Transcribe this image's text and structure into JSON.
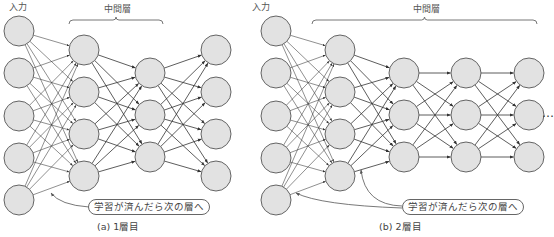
{
  "panels": [
    {
      "id": "a",
      "input_label": "入力",
      "hidden_label": "中間層",
      "bubble_text": "学習が済んだら次の層へ",
      "caption": "(a) 1層目",
      "layers": [
        {
          "x": 19,
          "ys": [
            31,
            73,
            116,
            158,
            200
          ]
        },
        {
          "x": 84,
          "ys": [
            50,
            92,
            134,
            176
          ]
        },
        {
          "x": 150,
          "ys": [
            73,
            115,
            157
          ]
        },
        {
          "x": 216,
          "ys": [
            50,
            92,
            134,
            176
          ]
        }
      ],
      "bracket": {
        "x1": 69,
        "x2": 163,
        "y": 20
      },
      "bubble": {
        "left": 88,
        "top": 199,
        "width": 112
      },
      "caption_pos": {
        "left": 97,
        "top": 222
      },
      "input_label_pos": {
        "left": 9,
        "top": 3
      },
      "hidden_label_pos": {
        "left": 104,
        "top": 5
      },
      "pointers": [
        {
          "from": [
            89,
            207
          ],
          "ctrl": [
            60,
            205
          ],
          "to": [
            51,
            193
          ]
        }
      ]
    },
    {
      "id": "b",
      "input_label": "入力",
      "hidden_label": "中間層",
      "bubble_text": "学習が済んだら次の層へ",
      "caption": "(b) 2層目",
      "layers": [
        {
          "x": 276,
          "ys": [
            31,
            73,
            116,
            158,
            200
          ]
        },
        {
          "x": 340,
          "ys": [
            50,
            92,
            134,
            176
          ]
        },
        {
          "x": 404,
          "ys": [
            73,
            115,
            157
          ]
        },
        {
          "x": 466,
          "ys": [
            73,
            115,
            157
          ]
        },
        {
          "x": 529,
          "ys": [
            73,
            115,
            157
          ]
        }
      ],
      "bracket": {
        "x1": 312,
        "x2": 537,
        "y": 20
      },
      "bubble": {
        "left": 402,
        "top": 199,
        "width": 112
      },
      "caption_pos": {
        "left": 379,
        "top": 222
      },
      "input_label_pos": {
        "left": 252,
        "top": 3
      },
      "hidden_label_pos": {
        "left": 413,
        "top": 5
      },
      "pointers": [
        {
          "from": [
            402,
            208
          ],
          "ctrl": [
            320,
            205
          ],
          "to": [
            296,
            193
          ]
        },
        {
          "from": [
            402,
            206
          ],
          "ctrl": [
            365,
            205
          ],
          "to": [
            361,
            170
          ]
        }
      ]
    }
  ],
  "continuation": "…",
  "colors": {
    "node_fill": "#e2e2e2",
    "node_stroke": "#555555",
    "edge": "#333333",
    "bracket": "#666666",
    "text": "#555555"
  },
  "node_radius": 15
}
